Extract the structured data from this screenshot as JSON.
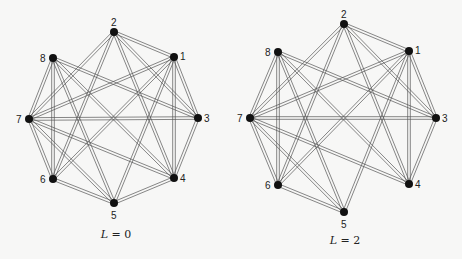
{
  "figure": {
    "panels": [
      {
        "id": "left",
        "caption_var": "L",
        "caption_eq": " = ",
        "caption_val": "0",
        "caption_pos": [
          116,
          238
        ],
        "nodes": [
          {
            "id": "1",
            "x": 174,
            "y": 57,
            "lx": 6,
            "ly": 3
          },
          {
            "id": "2",
            "x": 114,
            "y": 32,
            "lx": -3,
            "ly": -6
          },
          {
            "id": "3",
            "x": 198,
            "y": 118,
            "lx": 6,
            "ly": 4
          },
          {
            "id": "4",
            "x": 174,
            "y": 178,
            "lx": 6,
            "ly": 4
          },
          {
            "id": "5",
            "x": 114,
            "y": 203,
            "lx": -3,
            "ly": 16
          },
          {
            "id": "6",
            "x": 53,
            "y": 179,
            "lx": -13,
            "ly": 4
          },
          {
            "id": "7",
            "x": 29,
            "y": 119,
            "lx": -13,
            "ly": 4
          },
          {
            "id": "8",
            "x": 53,
            "y": 58,
            "lx": -13,
            "ly": 4
          }
        ],
        "edges": [
          [
            "1",
            "2"
          ],
          [
            "1",
            "3"
          ],
          [
            "1",
            "4"
          ],
          [
            "1",
            "5"
          ],
          [
            "1",
            "6"
          ],
          [
            "1",
            "7"
          ],
          [
            "2",
            "3"
          ],
          [
            "2",
            "4"
          ],
          [
            "2",
            "6"
          ],
          [
            "2",
            "7"
          ],
          [
            "3",
            "4"
          ],
          [
            "3",
            "7"
          ],
          [
            "3",
            "8"
          ],
          [
            "4",
            "5"
          ],
          [
            "4",
            "7"
          ],
          [
            "4",
            "8"
          ],
          [
            "5",
            "6"
          ],
          [
            "5",
            "7"
          ],
          [
            "5",
            "8"
          ],
          [
            "6",
            "7"
          ],
          [
            "6",
            "8"
          ],
          [
            "7",
            "8"
          ]
        ]
      },
      {
        "id": "right",
        "caption_var": "L",
        "caption_eq": " = ",
        "caption_val": "2",
        "caption_pos": [
          345,
          244
        ],
        "nodes": [
          {
            "id": "1",
            "x": 409,
            "y": 51,
            "lx": 6,
            "ly": 3
          },
          {
            "id": "2",
            "x": 344,
            "y": 24,
            "lx": -3,
            "ly": -6
          },
          {
            "id": "3",
            "x": 436,
            "y": 118,
            "lx": 6,
            "ly": 4
          },
          {
            "id": "4",
            "x": 409,
            "y": 184,
            "lx": 6,
            "ly": 4
          },
          {
            "id": "5",
            "x": 344,
            "y": 212,
            "lx": -3,
            "ly": 16
          },
          {
            "id": "6",
            "x": 278,
            "y": 185,
            "lx": -13,
            "ly": 4
          },
          {
            "id": "7",
            "x": 250,
            "y": 118,
            "lx": -13,
            "ly": 4
          },
          {
            "id": "8",
            "x": 278,
            "y": 52,
            "lx": -13,
            "ly": 4
          }
        ],
        "edges": [
          [
            "1",
            "2"
          ],
          [
            "1",
            "3"
          ],
          [
            "1",
            "4"
          ],
          [
            "1",
            "5"
          ],
          [
            "1",
            "6"
          ],
          [
            "1",
            "7"
          ],
          [
            "2",
            "3"
          ],
          [
            "2",
            "4"
          ],
          [
            "2",
            "6"
          ],
          [
            "2",
            "7"
          ],
          [
            "3",
            "4"
          ],
          [
            "3",
            "7"
          ],
          [
            "3",
            "8"
          ],
          [
            "4",
            "7"
          ],
          [
            "4",
            "8"
          ],
          [
            "5",
            "6"
          ],
          [
            "5",
            "7"
          ],
          [
            "5",
            "8"
          ],
          [
            "6",
            "7"
          ],
          [
            "6",
            "8"
          ],
          [
            "7",
            "8"
          ]
        ]
      }
    ]
  }
}
